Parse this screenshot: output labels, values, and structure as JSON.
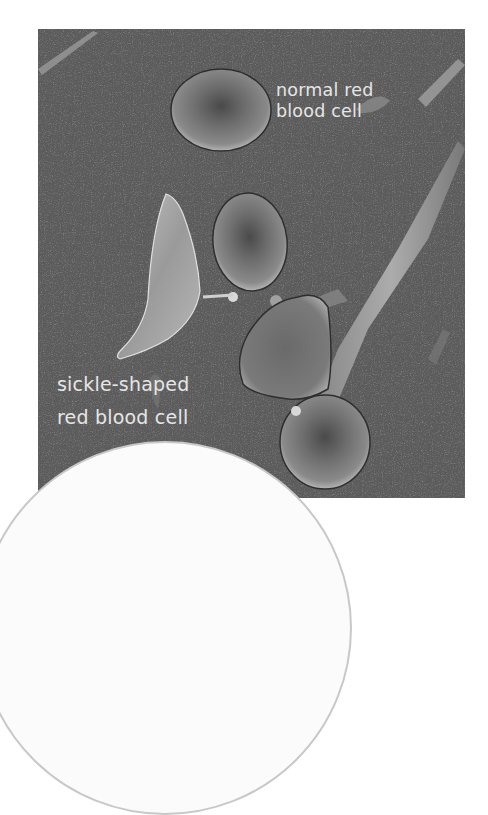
{
  "image": {
    "description": "Scanning electron micrograph of red blood cells with labels",
    "background_color": "#5c5c5c",
    "label_color": "#e6e6e6"
  },
  "labels": {
    "normal": {
      "line1": "normal red",
      "line2": "blood cell"
    },
    "sickle": {
      "line1": "sickle-shaped",
      "line2": "red blood cell"
    }
  },
  "overlay": {
    "shape": "circle",
    "fill": "#fbfbfb",
    "border": "#c8c8c8"
  }
}
